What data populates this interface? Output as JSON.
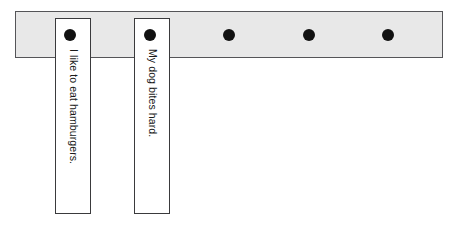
{
  "canvas": {
    "width": 457,
    "height": 238,
    "background_color": "#ffffff"
  },
  "rail": {
    "name": "horizontal-rail",
    "fill_color": "#e8e8e8",
    "border_color": "#555558",
    "x": 15,
    "y": 11,
    "width": 428,
    "height": 47
  },
  "dots": [
    {
      "label": "dot-1",
      "x": 70,
      "y": 35,
      "diameter": 12,
      "color": "#111111",
      "on_card": true
    },
    {
      "label": "dot-2",
      "x": 150,
      "y": 35,
      "diameter": 12,
      "color": "#111111",
      "on_card": true
    },
    {
      "label": "dot-3",
      "x": 229,
      "y": 35,
      "diameter": 12,
      "color": "#111111",
      "on_card": false
    },
    {
      "label": "dot-4",
      "x": 309,
      "y": 35,
      "diameter": 12,
      "color": "#111111",
      "on_card": false
    },
    {
      "label": "dot-5",
      "x": 388,
      "y": 35,
      "diameter": 12,
      "color": "#111111",
      "on_card": false
    }
  ],
  "cards": [
    {
      "label": "I like to eat hamburgers.",
      "x": 55,
      "y": 18,
      "width": 36,
      "height": 196,
      "fill_color": "#ffffff",
      "border_color": "#3a3a3c"
    },
    {
      "label": "My dog bites hard.",
      "x": 134,
      "y": 18,
      "width": 36,
      "height": 196,
      "fill_color": "#ffffff",
      "border_color": "#3a3a3c"
    }
  ]
}
